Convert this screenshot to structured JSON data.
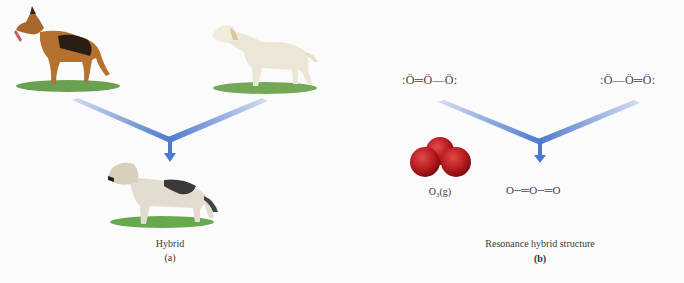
{
  "panel_a": {
    "parent_left": {
      "name": "german-shepherd",
      "colors": {
        "body": "#b5712f",
        "saddle": "#2a1d14",
        "grass": "#4f8f32"
      }
    },
    "parent_right": {
      "name": "labrador-retriever",
      "colors": {
        "body": "#ece6d6",
        "grass": "#5a9a38"
      }
    },
    "offspring": {
      "name": "hybrid-dog",
      "colors": {
        "body": "#e2ddd0",
        "patch": "#3a3a3a",
        "grass": "#4e9a30"
      }
    },
    "caption": "Hybrid",
    "letter": "(a)"
  },
  "panel_b": {
    "resonance_left": ":Ö═Ö—Ö:",
    "resonance_right": ":Ö—Ö═Ö:",
    "molecule_label": "O₃(g)",
    "hybrid_structure": "O┄═O┄═O",
    "caption": "Resonance hybrid structure",
    "letter": "(b)",
    "colors": {
      "atom": "#b0181c"
    }
  },
  "colors": {
    "arrow": "#4a74c9",
    "arrow_light": "#c8d6f2"
  }
}
